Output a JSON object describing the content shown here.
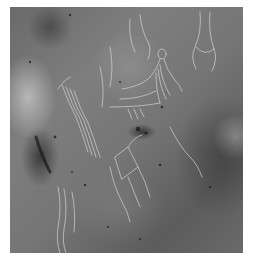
{
  "image": {
    "description": "Grayscale photograph of a rock surface with incised (engraved) human-like figures and wavy line motifs",
    "subject": "petroglyph engravings on rock",
    "palette": {
      "background": "#ffffff",
      "rock_mid": "#757575",
      "rock_dark": "#3a3a3a",
      "rock_light": "#d8d8d8",
      "engraving_highlight": "#d7d7d7"
    },
    "figures": [
      {
        "name": "upper-center-figure",
        "position": "top center-right",
        "note": "figure with round head and fanned lines below"
      },
      {
        "name": "upper-right-figure",
        "position": "top right",
        "note": "tall elongated outline"
      },
      {
        "name": "left-center-fringe",
        "position": "center left",
        "note": "bundle of parallel wavy lines"
      },
      {
        "name": "lower-center-figure",
        "position": "lower center",
        "note": "angular outlined figure"
      },
      {
        "name": "lower-left-lines",
        "position": "bottom left",
        "note": "vertical wavy lines"
      }
    ]
  }
}
